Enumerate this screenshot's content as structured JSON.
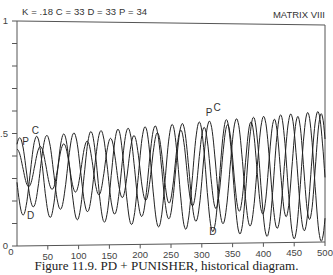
{
  "header": {
    "params": "K = .18  C = 33  D = 33  P = 34",
    "matrix_label": "MATRIX VIII"
  },
  "caption": "Figure 11.9. PD + PUNISHER, historical diagram.",
  "chart_data": {
    "type": "line",
    "title": "PD + PUNISHER, historical diagram",
    "subtitle": "K = .18  C = 33  D = 33  P = 34",
    "annotation": "MATRIX VIII",
    "xlabel": "",
    "ylabel": "",
    "xlim": [
      0,
      500
    ],
    "ylim": [
      0,
      1
    ],
    "grid": false,
    "legend": "inline labels",
    "x_ticks": [
      0,
      50,
      100,
      150,
      200,
      250,
      300,
      350,
      400,
      450,
      500
    ],
    "x_tick_labels": [
      "0",
      "50",
      "100",
      "150",
      "200",
      "250",
      "300",
      "350",
      "400",
      "450",
      "500"
    ],
    "y_ticks": [
      0,
      0.1,
      0.2,
      0.3,
      0.4,
      0.5,
      0.6,
      0.7,
      0.8,
      0.9,
      1
    ],
    "y_tick_labels": {
      "0": "0",
      "0.5": ".5",
      "1": "1"
    },
    "series": [
      {
        "name": "C",
        "center": 0.33,
        "amp_start": 0.15,
        "amp_end": 0.27,
        "period": 44,
        "phase": 0.95,
        "label_pos": [
          [
            30,
            0.5
          ],
          [
            325,
            0.6
          ]
        ]
      },
      {
        "name": "D",
        "center": 0.31,
        "amp_start": 0.17,
        "amp_end": 0.29,
        "period": 44,
        "phase": 3.3,
        "label_pos": [
          [
            22,
            0.12
          ],
          [
            318,
            0.05
          ]
        ]
      },
      {
        "name": "P",
        "center": 0.35,
        "amp_start": 0.08,
        "amp_end": 0.24,
        "period": 38,
        "phase": 1.6,
        "label_pos": [
          [
            14,
            0.45
          ],
          [
            312,
            0.58
          ]
        ]
      }
    ],
    "samples_x": [
      0,
      25,
      50,
      75,
      100,
      125,
      150,
      175,
      200,
      225,
      250,
      275,
      300,
      325,
      350,
      375,
      400,
      425,
      450,
      475,
      500
    ],
    "approx_ranges": {
      "C": {
        "min_early": 0.18,
        "max_early": 0.49,
        "min_late": 0.06,
        "max_late": 0.62
      },
      "D": {
        "min_early": 0.14,
        "max_early": 0.47,
        "min_late": 0.03,
        "max_late": 0.6
      },
      "P": {
        "min_early": 0.27,
        "max_early": 0.43,
        "min_late": 0.1,
        "max_late": 0.58
      }
    }
  }
}
